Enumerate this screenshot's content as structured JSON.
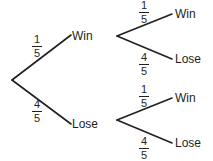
{
  "diagram": {
    "type": "probability-tree",
    "title": "",
    "stroke_color": "#231f20",
    "background_color": "#ffffff",
    "root": {
      "branches": [
        {
          "probability": {
            "numerator": "1",
            "denominator": "5"
          },
          "outcome": "Win",
          "children": [
            {
              "probability": {
                "numerator": "1",
                "denominator": "5"
              },
              "outcome": "Win"
            },
            {
              "probability": {
                "numerator": "4",
                "denominator": "5"
              },
              "outcome": "Lose"
            }
          ]
        },
        {
          "probability": {
            "numerator": "4",
            "denominator": "5"
          },
          "outcome": "Lose",
          "children": [
            {
              "probability": {
                "numerator": "1",
                "denominator": "5"
              },
              "outcome": "Win"
            },
            {
              "probability": {
                "numerator": "4",
                "denominator": "5"
              },
              "outcome": "Lose"
            }
          ]
        }
      ]
    }
  }
}
